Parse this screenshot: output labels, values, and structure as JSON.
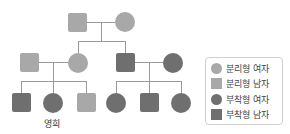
{
  "pedigree": {
    "colors": {
      "separation_type": "#a8a8a8",
      "attached_type": "#6f6f6f"
    },
    "generation1": [
      {
        "sex": "male",
        "type": "분리형"
      },
      {
        "sex": "female",
        "type": "분리형"
      }
    ],
    "generation2": [
      {
        "sex": "male",
        "type": "분리형"
      },
      {
        "sex": "female",
        "type": "분리형"
      },
      {
        "sex": "male",
        "type": "부착형"
      },
      {
        "sex": "female",
        "type": "부착형"
      }
    ],
    "generation3": [
      {
        "sex": "male",
        "type": "부착형"
      },
      {
        "sex": "female",
        "type": "부착형",
        "label": "영희"
      },
      {
        "sex": "male",
        "type": "분리형"
      },
      {
        "sex": "female",
        "type": "부착형"
      },
      {
        "sex": "male",
        "type": "부착형"
      },
      {
        "sex": "female",
        "type": "부착형"
      }
    ],
    "younghee_label": "영희"
  },
  "legend": {
    "items": [
      {
        "shape": "circle",
        "label": "분리형 여자"
      },
      {
        "shape": "square",
        "label": "분리형 남자"
      },
      {
        "shape": "circle",
        "label": "부착형 여자"
      },
      {
        "shape": "square",
        "label": "부착형 남자"
      }
    ]
  }
}
